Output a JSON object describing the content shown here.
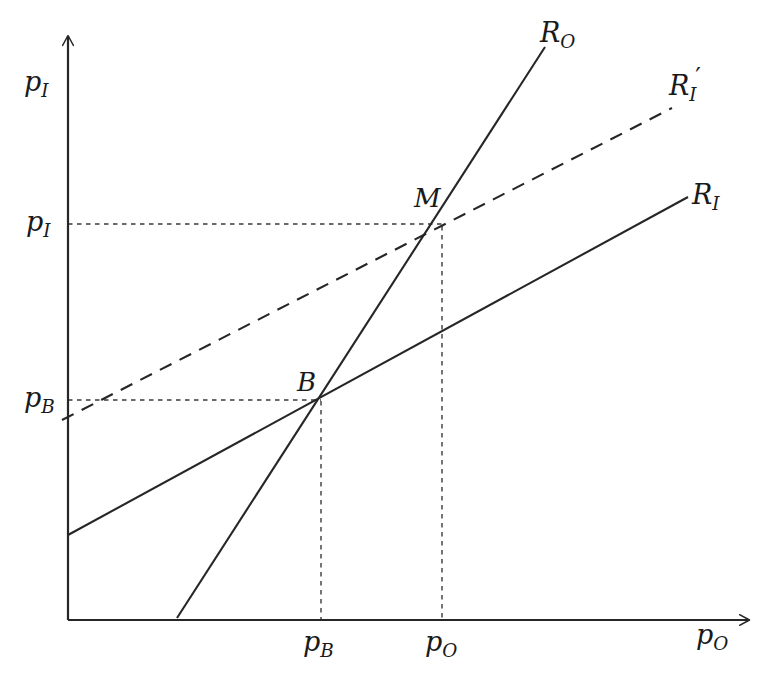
{
  "figure": {
    "kind": "line-diagram",
    "background_color": "#ffffff",
    "stroke_color": "#262626",
    "width": 774,
    "height": 679
  },
  "axes": {
    "y_axis_label": "p",
    "y_axis_sub": "I",
    "x_axis_label": "p",
    "x_axis_sub": "O",
    "origin": {
      "x": 68,
      "y": 620
    },
    "y_axis_tip": {
      "x": 68,
      "y": 30
    },
    "x_axis_tip": {
      "x": 755,
      "y": 620
    },
    "arrowhead": "open-arrow"
  },
  "y_ticks": [
    {
      "name": "p-sub-I",
      "base": "p",
      "sub": "I",
      "value_y": 224
    },
    {
      "name": "p-sub-B",
      "base": "p",
      "sub": "B",
      "value_y": 400
    }
  ],
  "x_ticks": [
    {
      "name": "p-sub-B",
      "base": "p",
      "sub": "B",
      "value_x": 321
    },
    {
      "name": "p-sub-O",
      "base": "p",
      "sub": "O",
      "value_x": 442
    }
  ],
  "curves": [
    {
      "id": "R_O",
      "label_base": "R",
      "label_sub": "O",
      "label_prime": "",
      "style": "solid",
      "description": "steep upward sloping outsider reaction function",
      "from": {
        "x": 177,
        "y": 618
      },
      "to": {
        "x": 545,
        "y": 47
      }
    },
    {
      "id": "R_I_prime",
      "label_base": "R",
      "label_sub": "I",
      "label_prime": "′",
      "style": "dashed",
      "description": "shifted insider reaction function",
      "from": {
        "x": 62,
        "y": 420
      },
      "to": {
        "x": 672,
        "y": 108
      }
    },
    {
      "id": "R_I",
      "label_base": "R",
      "label_sub": "I",
      "label_prime": "",
      "style": "solid",
      "description": "insider reaction function",
      "from": {
        "x": 68,
        "y": 535
      },
      "to": {
        "x": 688,
        "y": 197
      }
    }
  ],
  "points": [
    {
      "id": "M",
      "label": "M",
      "description": "intersection of R_O and R_I prime",
      "x": 442,
      "y": 225
    },
    {
      "id": "B",
      "label": "B",
      "description": "intersection of R_O and R_I",
      "x": 321,
      "y": 400
    }
  ],
  "guides": [
    {
      "id": "guide-h-M",
      "style": "dotted",
      "orientation": "horizontal",
      "from": {
        "x": 68,
        "y": 224
      },
      "to": {
        "x": 442,
        "y": 224
      }
    },
    {
      "id": "guide-v-M",
      "style": "dotted",
      "orientation": "vertical",
      "from": {
        "x": 442,
        "y": 225
      },
      "to": {
        "x": 442,
        "y": 620
      }
    },
    {
      "id": "guide-h-B",
      "style": "dotted",
      "orientation": "horizontal",
      "from": {
        "x": 68,
        "y": 400
      },
      "to": {
        "x": 321,
        "y": 400
      }
    },
    {
      "id": "guide-v-B",
      "style": "dotted",
      "orientation": "vertical",
      "from": {
        "x": 321,
        "y": 400
      },
      "to": {
        "x": 321,
        "y": 620
      }
    }
  ]
}
